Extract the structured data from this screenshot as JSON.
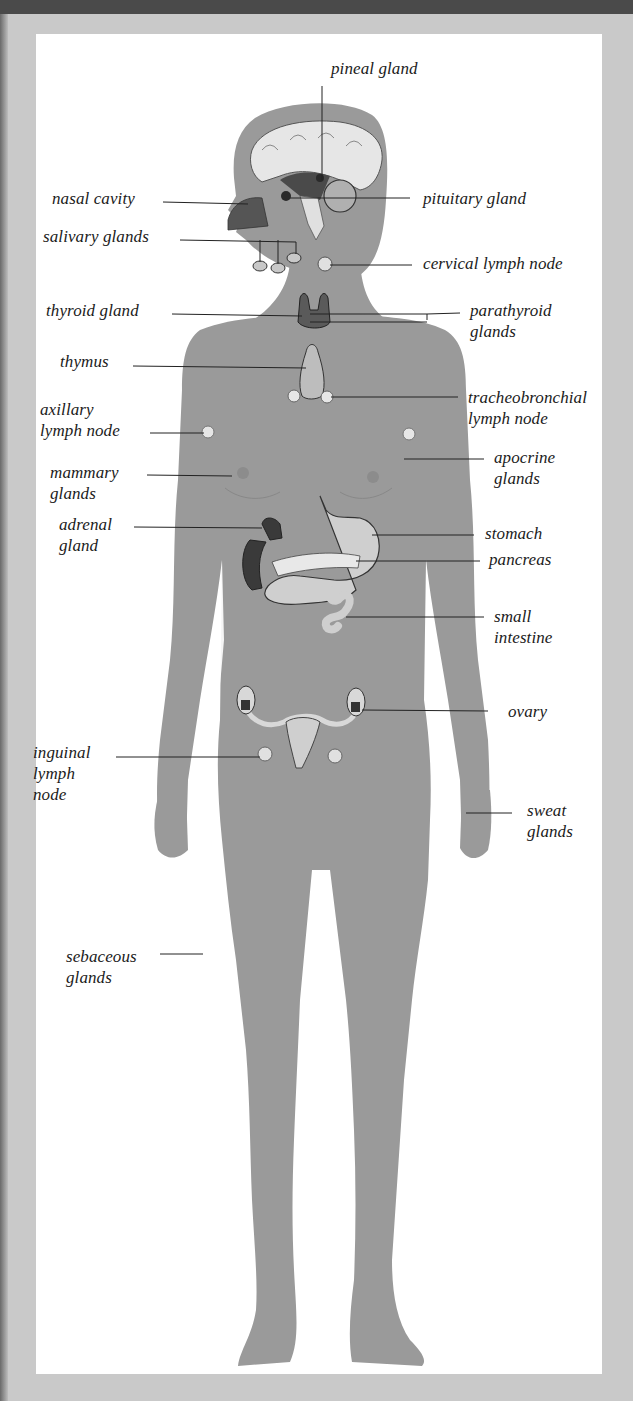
{
  "diagram": {
    "colors": {
      "background_frame": "#c9c9c9",
      "top_bar": "#4a4a4a",
      "panel": "#ffffff",
      "body_silhouette": "#9a9a9a",
      "organ_dark": "#4a4a4a",
      "organ_light": "#d8d8d8",
      "leader_line": "#222222",
      "label_text": "#1b1b1b"
    },
    "labels": {
      "pineal_gland": "pineal gland",
      "nasal_cavity": "nasal cavity",
      "pituitary_gland": "pituitary gland",
      "salivary_glands": "salivary glands",
      "cervical_lymph_node": "cervical lymph node",
      "thyroid_gland": "thyroid gland",
      "parathyroid_glands": "parathyroid\nglands",
      "thymus": "thymus",
      "tracheobronchial_lymph_node": "tracheobronchial\nlymph node",
      "axillary_lymph_node": "axillary\nlymph node",
      "apocrine_glands": "apocrine\nglands",
      "mammary_glands": "mammary\nglands",
      "adrenal_gland": "adrenal\ngland",
      "stomach": "stomach",
      "pancreas": "pancreas",
      "small_intestine": "small\nintestine",
      "ovary": "ovary",
      "inguinal_lymph_node": "inguinal\nlymph\nnode",
      "sweat_glands": "sweat\nglands",
      "sebaceous_glands": "sebaceous\nglands"
    }
  }
}
